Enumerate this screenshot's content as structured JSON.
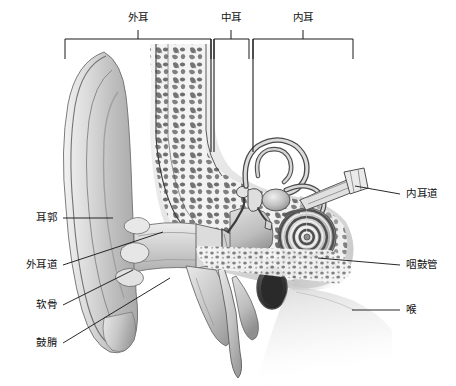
{
  "figure": {
    "background_color": "#ffffff",
    "line_color": "#1a1a1a",
    "text_color": "#111111"
  },
  "region_brackets": [
    {
      "id": "outer-ear",
      "label": "外耳",
      "label_x": 138,
      "label_y": 18,
      "tick_x": 138,
      "left": 65,
      "right": 211
    },
    {
      "id": "middle-ear",
      "label": "中耳",
      "label_x": 231,
      "label_y": 18,
      "tick_x": 231,
      "left": 214,
      "right": 249
    },
    {
      "id": "inner-ear",
      "label": "内耳",
      "label_x": 303,
      "label_y": 18,
      "tick_x": 303,
      "left": 253,
      "right": 353
    }
  ],
  "bracket_geometry": {
    "bar_y": 39,
    "tick_top_y": 30,
    "stem_bottom_y": 59,
    "divider_bottom_y": 152
  },
  "callouts_left": [
    {
      "id": "auricle",
      "label": "耳郭",
      "label_x": 57,
      "label_y": 218,
      "line_x1": 63,
      "line_y1": 218,
      "line_x2": 113,
      "line_y2": 218
    },
    {
      "id": "ear-canal",
      "label": "外耳道",
      "label_x": 57,
      "label_y": 265,
      "line_x1": 63,
      "line_y1": 265,
      "line_x2": 163,
      "line_y2": 232
    },
    {
      "id": "cartilage",
      "label": "软骨",
      "label_x": 57,
      "label_y": 305,
      "line_x1": 63,
      "line_y1": 305,
      "line_x2": 133,
      "line_y2": 270
    },
    {
      "id": "tympanic-membrane",
      "label": "鼓膌",
      "label_x": 57,
      "label_y": 343,
      "line_x1": 63,
      "line_y1": 343,
      "line_x2": 170,
      "line_y2": 278
    }
  ],
  "callouts_right": [
    {
      "id": "internal-auditory-canal",
      "label": "内耳道",
      "label_x": 406,
      "label_y": 194,
      "line_x1": 400,
      "line_y1": 194,
      "line_x2": 355,
      "line_y2": 186
    },
    {
      "id": "eustachian-tube",
      "label": "咽鼓管",
      "label_x": 406,
      "label_y": 265,
      "line_x1": 400,
      "line_y1": 265,
      "line_x2": 318,
      "line_y2": 258
    },
    {
      "id": "larynx",
      "label": "喉",
      "label_x": 406,
      "label_y": 310,
      "line_x1": 400,
      "line_y1": 310,
      "line_x2": 352,
      "line_y2": 310
    }
  ],
  "anatomy_parts": [
    {
      "id": "pinna",
      "name": "耳郭"
    },
    {
      "id": "external-ear-canal",
      "name": "外耳道"
    },
    {
      "id": "ear-cartilage",
      "name": "软骨"
    },
    {
      "id": "eardrum",
      "name": "鼓膌"
    },
    {
      "id": "ossicles",
      "name": "听小骨"
    },
    {
      "id": "cochlea",
      "name": "耳蜗"
    },
    {
      "id": "semicircular-canals",
      "name": "半规管"
    },
    {
      "id": "internal-auditory-canal",
      "name": "内耳道"
    },
    {
      "id": "eustachian-tube",
      "name": "咽鼓管"
    },
    {
      "id": "temporal-bone",
      "name": "颞骨"
    },
    {
      "id": "mastoid-process",
      "name": "乳突"
    },
    {
      "id": "styloid-process",
      "name": "茎突"
    }
  ]
}
